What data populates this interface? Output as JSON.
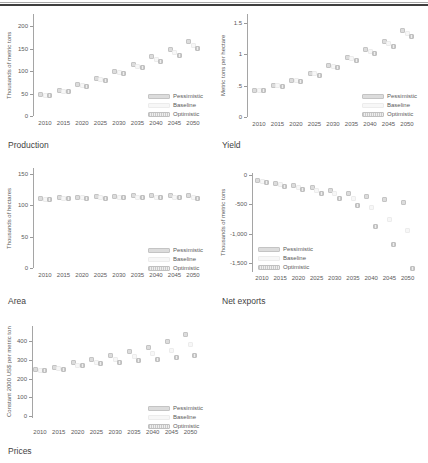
{
  "page": {
    "background": "#ffffff"
  },
  "scenarios": [
    {
      "key": "pess",
      "label": "Pessimistic"
    },
    {
      "key": "base",
      "label": "Baseline"
    },
    {
      "key": "opt",
      "label": "Optimistic"
    }
  ],
  "colors": {
    "pessimistic_fill": "#dcdcdc",
    "baseline_fill": "#f7f7f7",
    "optimistic_stripe": "#c9c9c9",
    "axis": "#a5a5a5",
    "text": "#555555",
    "top_rule": "#3f3f3f"
  },
  "chart_data": [
    {
      "id": "production",
      "type": "scatter",
      "title": "Production",
      "ylabel": "Thousands of metric tons",
      "x": [
        "2010",
        "2015",
        "2020",
        "2025",
        "2030",
        "2035",
        "2040",
        "2045",
        "2050"
      ],
      "ylim": [
        0,
        200
      ],
      "yticks": [
        {
          "label": "200",
          "v": 200
        },
        {
          "label": "150",
          "v": 150
        },
        {
          "label": "100",
          "v": 100
        },
        {
          "label": "50",
          "v": 50
        },
        {
          "label": "0",
          "v": 0
        }
      ],
      "legend_position": "bottom-right",
      "series": [
        {
          "name": "Pessimistic",
          "values": [
            47,
            57,
            69,
            83,
            100,
            115,
            132,
            148,
            166
          ]
        },
        {
          "name": "Baseline",
          "values": [
            46,
            55,
            67,
            81,
            97,
            111,
            126,
            141,
            156
          ]
        },
        {
          "name": "Optimistic",
          "values": [
            45,
            54,
            66,
            79,
            94,
            107,
            121,
            134,
            149
          ]
        }
      ]
    },
    {
      "id": "yield",
      "type": "scatter",
      "title": "Yield",
      "ylabel": "Metric tons per hectare",
      "x": [
        "2010",
        "2015",
        "2020",
        "2025",
        "2030",
        "2035",
        "2040",
        "2045",
        "2050"
      ],
      "ylim": [
        0,
        1.5
      ],
      "yticks": [
        {
          "label": "1.5",
          "v": 1.5
        },
        {
          "label": "1",
          "v": 1
        },
        {
          "label": ".5",
          "v": 0.5
        },
        {
          "label": "0",
          "v": 0
        }
      ],
      "legend_position": "bottom-right",
      "series": [
        {
          "name": "Pessimistic",
          "values": [
            0.43,
            0.5,
            0.59,
            0.7,
            0.82,
            0.95,
            1.08,
            1.21,
            1.38
          ]
        },
        {
          "name": "Baseline",
          "values": [
            0.43,
            0.5,
            0.58,
            0.69,
            0.81,
            0.93,
            1.05,
            1.17,
            1.33
          ]
        },
        {
          "name": "Optimistic",
          "values": [
            0.42,
            0.49,
            0.57,
            0.67,
            0.79,
            0.9,
            1.02,
            1.13,
            1.29
          ]
        }
      ]
    },
    {
      "id": "area",
      "type": "scatter",
      "title": "Area",
      "ylabel": "Thousands of hectares",
      "x": [
        "2010",
        "2015",
        "2020",
        "2025",
        "2030",
        "2035",
        "2040",
        "2045",
        "2050"
      ],
      "ylim": [
        0,
        150
      ],
      "yticks": [
        {
          "label": "150",
          "v": 150
        },
        {
          "label": "100",
          "v": 100
        },
        {
          "label": "50",
          "v": 50
        },
        {
          "label": "0",
          "v": 0
        }
      ],
      "legend_position": "bottom-right",
      "series": [
        {
          "name": "Pessimistic",
          "values": [
            111,
            112,
            113,
            114,
            114,
            115,
            115,
            116,
            116
          ]
        },
        {
          "name": "Baseline",
          "values": [
            110,
            111,
            112,
            112,
            113,
            113,
            113,
            113,
            113
          ]
        },
        {
          "name": "Optimistic",
          "values": [
            110,
            111,
            111,
            111,
            112,
            112,
            112,
            112,
            111
          ]
        }
      ]
    },
    {
      "id": "net_exports",
      "type": "scatter",
      "title": "Net exports",
      "ylabel": "Thousands of metric tons",
      "x": [
        "2010",
        "2015",
        "2020",
        "2025",
        "2030",
        "2035",
        "2040",
        "2045",
        "2050"
      ],
      "ylim": [
        -1500,
        0
      ],
      "yticks": [
        {
          "label": "0",
          "v": 0
        },
        {
          "label": "-500",
          "v": -500
        },
        {
          "label": "-1,000",
          "v": -1000
        },
        {
          "label": "-1,500",
          "v": -1500
        }
      ],
      "legend_position": "bottom-left",
      "series": [
        {
          "name": "Pessimistic",
          "values": [
            -100,
            -150,
            -180,
            -220,
            -260,
            -310,
            -360,
            -420,
            -470
          ]
        },
        {
          "name": "Baseline",
          "values": [
            -115,
            -170,
            -210,
            -260,
            -320,
            -400,
            -560,
            -750,
            -950
          ]
        },
        {
          "name": "Optimistic",
          "values": [
            -130,
            -190,
            -240,
            -310,
            -400,
            -520,
            -870,
            -1190,
            -1600
          ]
        }
      ]
    },
    {
      "id": "prices",
      "type": "scatter",
      "title": "Prices",
      "ylabel": "Constant 2000 US$ per metric ton",
      "x": [
        "2010",
        "2015",
        "2020",
        "2025",
        "2030",
        "2035",
        "2040",
        "2045",
        "2050"
      ],
      "ylim": [
        0,
        400
      ],
      "yticks": [
        {
          "label": "400",
          "v": 400
        },
        {
          "label": "300",
          "v": 300
        },
        {
          "label": "200",
          "v": 200
        },
        {
          "label": "100",
          "v": 100
        },
        {
          "label": "0",
          "v": 0
        }
      ],
      "legend_position": "bottom-right",
      "series": [
        {
          "name": "Pessimistic",
          "values": [
            246,
            260,
            284,
            303,
            322,
            342,
            368,
            398,
            434
          ]
        },
        {
          "name": "Baseline",
          "values": [
            244,
            253,
            272,
            286,
            301,
            316,
            331,
            347,
            380
          ]
        },
        {
          "name": "Optimistic",
          "values": [
            242,
            250,
            268,
            278,
            288,
            296,
            303,
            313,
            322
          ]
        }
      ]
    }
  ]
}
